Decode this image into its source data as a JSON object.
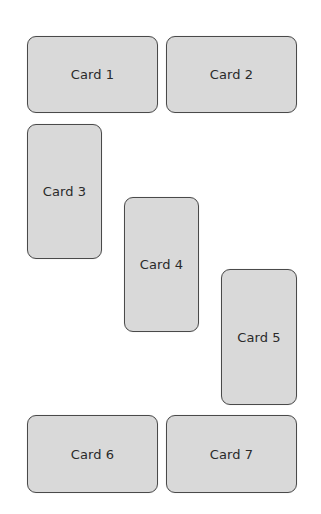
{
  "cards": [
    {
      "label": "Card 1"
    },
    {
      "label": "Card 2"
    },
    {
      "label": "Card 3"
    },
    {
      "label": "Card 4"
    },
    {
      "label": "Card 5"
    },
    {
      "label": "Card 6"
    },
    {
      "label": "Card 7"
    }
  ],
  "colors": {
    "card_fill": "#d9d9d9",
    "card_border": "#4a4a4a",
    "text": "#2a2a2a",
    "background": "#ffffff"
  }
}
